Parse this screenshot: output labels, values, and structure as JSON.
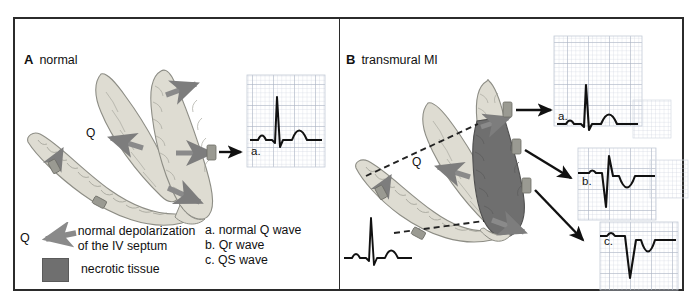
{
  "figure": {
    "panels": [
      {
        "id": "A",
        "letter": "A",
        "label": "normal"
      },
      {
        "id": "B",
        "letter": "B",
        "label": "transmural MI"
      }
    ]
  },
  "legend": {
    "q_symbol": "Q",
    "arrow_icon": "left-arrow-icon",
    "depolarization_line1": "normal depolarization",
    "depolarization_line2": "of the IV septum",
    "swatch_icon": "necrotic-tissue-swatch",
    "necrotic_label": "necrotic tissue",
    "necrotic_color": "#6f6f6f",
    "myocardium_color": "#dedcd2",
    "arrow_color": "#808080"
  },
  "wave_list": [
    "a. normal Q wave",
    "b. Qr wave",
    "c. QS wave"
  ],
  "panel_a": {
    "septum_label": "Q",
    "ecg": {
      "label": "a.",
      "name": "normal Q wave"
    }
  },
  "panel_b": {
    "septum_label": "Q",
    "ecgs": [
      {
        "label": "a.",
        "name": "normal Q wave"
      },
      {
        "label": "b.",
        "name": "Qr wave"
      },
      {
        "label": "c.",
        "name": "QS wave"
      }
    ],
    "inset_ecg": {
      "name": "reference normal complex"
    }
  },
  "colors": {
    "frame": "#2b2b2b",
    "grid_minor": "#cfd6e0",
    "grid_major": "#aab3c2",
    "trace": "#111111",
    "background": "#ffffff"
  }
}
